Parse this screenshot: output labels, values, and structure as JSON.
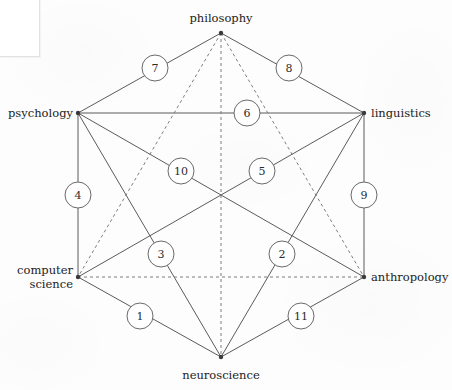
{
  "figure": {
    "name": "cognitive-science-hexagon",
    "canvas": {
      "width": 452,
      "height": 390
    },
    "colors": {
      "background": "#fdfdfd",
      "solid_line": "#5b5b5b",
      "dashed_line": "#7d7d7d",
      "badge_stroke": "#6a6a6a",
      "badge_fill": "#ffffff",
      "text": "#222222",
      "vertex_dot": "#3a3a3a"
    }
  },
  "vertices": [
    {
      "id": "philosophy",
      "label": "philosophy",
      "x": 221,
      "y": 33,
      "anchor": "top",
      "label_x": 221,
      "label_y": 26
    },
    {
      "id": "linguistics",
      "label": "linguistics",
      "x": 364,
      "y": 113,
      "anchor": "right",
      "label_x": 371,
      "label_y": 114
    },
    {
      "id": "anthropology",
      "label": "anthropology",
      "x": 364,
      "y": 277,
      "anchor": "right",
      "label_x": 371,
      "label_y": 278
    },
    {
      "id": "neuroscience",
      "label": "neuroscience",
      "x": 221,
      "y": 357,
      "anchor": "bottom",
      "label_x": 221,
      "label_y": 369
    },
    {
      "id": "computer-science",
      "label": "computer\nscience",
      "x": 78,
      "y": 277,
      "anchor": "left",
      "label_x": 73,
      "label_y": 278
    },
    {
      "id": "psychology",
      "label": "psychology",
      "x": 78,
      "y": 113,
      "anchor": "left",
      "label_x": 73,
      "label_y": 114
    }
  ],
  "edges": [
    {
      "id": "edge-philosophy-linguistics",
      "from": "philosophy",
      "to": "linguistics",
      "style": "solid"
    },
    {
      "id": "edge-linguistics-anthropology",
      "from": "linguistics",
      "to": "anthropology",
      "style": "solid"
    },
    {
      "id": "edge-anthropology-neuroscience",
      "from": "anthropology",
      "to": "neuroscience",
      "style": "solid"
    },
    {
      "id": "edge-neuroscience-computer-science",
      "from": "neuroscience",
      "to": "computer-science",
      "style": "solid"
    },
    {
      "id": "edge-computer-science-psychology",
      "from": "computer-science",
      "to": "psychology",
      "style": "solid"
    },
    {
      "id": "edge-psychology-philosophy",
      "from": "psychology",
      "to": "philosophy",
      "style": "solid"
    },
    {
      "id": "edge-psychology-linguistics",
      "from": "psychology",
      "to": "linguistics",
      "style": "solid"
    },
    {
      "id": "edge-psychology-anthropology",
      "from": "psychology",
      "to": "anthropology",
      "style": "solid"
    },
    {
      "id": "edge-psychology-neuroscience",
      "from": "psychology",
      "to": "neuroscience",
      "style": "solid"
    },
    {
      "id": "edge-linguistics-neuroscience",
      "from": "linguistics",
      "to": "neuroscience",
      "style": "solid"
    },
    {
      "id": "edge-linguistics-computer-science",
      "from": "linguistics",
      "to": "computer-science",
      "style": "solid"
    },
    {
      "id": "edge-computer-science-anthropology",
      "from": "computer-science",
      "to": "anthropology",
      "style": "dashed"
    },
    {
      "id": "edge-philosophy-neuroscience",
      "from": "philosophy",
      "to": "neuroscience",
      "style": "dashed"
    },
    {
      "id": "edge-philosophy-computer-science",
      "from": "philosophy",
      "to": "computer-science",
      "style": "dashed"
    },
    {
      "id": "edge-philosophy-anthropology",
      "from": "philosophy",
      "to": "anthropology",
      "style": "dashed"
    }
  ],
  "badges": [
    {
      "id": "badge-1",
      "label": "1",
      "x": 140,
      "y": 316,
      "on_edge": "edge-neuroscience-computer-science"
    },
    {
      "id": "badge-2",
      "label": "2",
      "x": 282,
      "y": 254,
      "on_edge": "edge-linguistics-neuroscience"
    },
    {
      "id": "badge-3",
      "label": "3",
      "x": 161,
      "y": 254,
      "on_edge": "edge-psychology-neuroscience"
    },
    {
      "id": "badge-4",
      "label": "4",
      "x": 78,
      "y": 195,
      "on_edge": "edge-computer-science-psychology"
    },
    {
      "id": "badge-5",
      "label": "5",
      "x": 262,
      "y": 171,
      "on_edge": "edge-linguistics-computer-science"
    },
    {
      "id": "badge-6",
      "label": "6",
      "x": 247,
      "y": 113,
      "on_edge": "edge-psychology-linguistics"
    },
    {
      "id": "badge-7",
      "label": "7",
      "x": 155,
      "y": 68,
      "on_edge": "edge-psychology-philosophy"
    },
    {
      "id": "badge-8",
      "label": "8",
      "x": 289,
      "y": 68,
      "on_edge": "edge-philosophy-linguistics"
    },
    {
      "id": "badge-9",
      "label": "9",
      "x": 364,
      "y": 195,
      "on_edge": "edge-linguistics-anthropology"
    },
    {
      "id": "badge-10",
      "label": "10",
      "x": 181,
      "y": 171,
      "on_edge": "edge-psychology-anthropology"
    },
    {
      "id": "badge-11",
      "label": "11",
      "x": 301,
      "y": 316,
      "on_edge": "edge-anthropology-neuroscience"
    }
  ],
  "badge_radius": 13
}
